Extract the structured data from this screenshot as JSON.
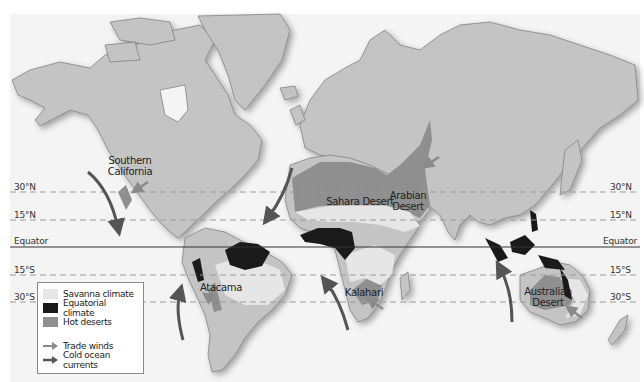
{
  "map": {
    "title": "World climate zones: savanna, equatorial and hot deserts",
    "colors": {
      "ocean": "#ffffff",
      "land": "#c4c4c4",
      "land_outline": "#777777",
      "savanna": "#e6e6e6",
      "equatorial": "#1a1a1a",
      "hot_desert": "#8f8f8f",
      "trade_wind_arrow": "#8a8a8a",
      "cold_current_arrow": "#555555",
      "latitude_line": "#9a9a9a",
      "equator_line": "#333333"
    },
    "latitudes": [
      {
        "id": "30N",
        "label": "30°N",
        "y": 192,
        "style": "dashed"
      },
      {
        "id": "15N",
        "label": "15°N",
        "y": 220,
        "style": "dashed"
      },
      {
        "id": "equator",
        "label": "Equator",
        "y": 247,
        "style": "solid"
      },
      {
        "id": "15S",
        "label": "15°S",
        "y": 275,
        "style": "dashed"
      },
      {
        "id": "30S",
        "label": "30°S",
        "y": 302,
        "style": "dashed"
      }
    ],
    "regions": [
      {
        "id": "southern-california",
        "label_line1": "Southern",
        "label_line2": "California"
      },
      {
        "id": "sahara",
        "label": "Sahara Desert"
      },
      {
        "id": "arabian",
        "label_line1": "Arabian",
        "label_line2": "Desert"
      },
      {
        "id": "atacama",
        "label": "Atacama"
      },
      {
        "id": "kalahari",
        "label": "Kalahari"
      },
      {
        "id": "australian",
        "label_line1": "Australian",
        "label_line2": "Desert"
      }
    ]
  },
  "legend": {
    "items": [
      {
        "label": "Savanna climate",
        "type": "swatch",
        "color": "#e6e6e6"
      },
      {
        "label": "Equatorial climate",
        "type": "swatch",
        "color": "#1a1a1a"
      },
      {
        "label": "Hot deserts",
        "type": "swatch",
        "color": "#8f8f8f"
      },
      {
        "label": "Trade winds",
        "type": "arrow",
        "color": "#8a8a8a"
      },
      {
        "label": "Cold ocean currents",
        "type": "arrow",
        "color": "#555555"
      }
    ]
  }
}
